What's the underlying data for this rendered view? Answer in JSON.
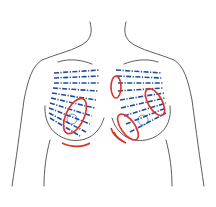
{
  "figure": {
    "colors": {
      "outline": "#333333",
      "lines": "#1f4e9c",
      "markings": "#e0302a",
      "background": "#ffffff"
    },
    "left_breast_markings": [
      "oblique ellipse over nipple-areola region",
      "curved arc below inframammary fold"
    ],
    "right_breast_markings": [
      "vertical ellipse at medial upper area",
      "oblique ellipse at upper lateral area",
      "oblique ellipse at lower medial area",
      "curved arcs at lower medial edge"
    ]
  }
}
